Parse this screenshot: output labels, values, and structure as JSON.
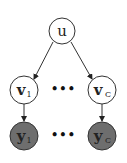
{
  "diagram": {
    "type": "graphical-model",
    "colors": {
      "stroke": "#333333",
      "observed_fill": "#6e6e6e",
      "latent_fill": "#ffffff",
      "text": "#222222"
    },
    "nodes": {
      "u": {
        "label": "u",
        "sub": "",
        "observed": false
      },
      "v1": {
        "label": "v",
        "sub": "1",
        "observed": false
      },
      "vc": {
        "label": "v",
        "sub": "C",
        "observed": false
      },
      "y1": {
        "label": "y",
        "sub": "1",
        "observed": true
      },
      "yc": {
        "label": "y",
        "sub": "C",
        "observed": true
      }
    },
    "edges": [
      {
        "from": "u",
        "to": "v1"
      },
      {
        "from": "u",
        "to": "vc"
      },
      {
        "from": "v1",
        "to": "y1"
      },
      {
        "from": "vc",
        "to": "yc"
      }
    ],
    "ellipsis": "•••"
  }
}
